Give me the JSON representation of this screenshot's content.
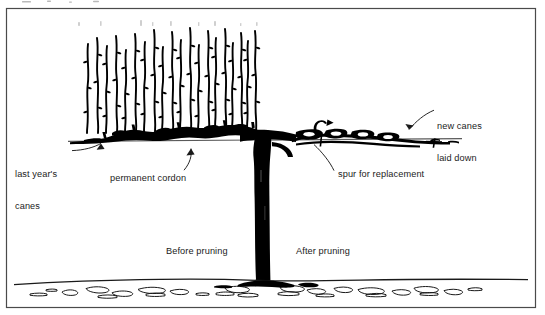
{
  "figure": {
    "frame": {
      "stroke": "#4a4a4a",
      "x": 6,
      "y": 8,
      "width": 530,
      "height": 300
    },
    "colors": {
      "ink": "#000000",
      "label_text": "#1b1b1b",
      "frame": "#4a4a4a",
      "wire": "#555555",
      "soil_outline": "#1a1a1a",
      "background": "#ffffff"
    },
    "labels": [
      {
        "name": "last-years-canes",
        "line1": "last year's",
        "line2": "canes",
        "x": 15,
        "y": 147
      },
      {
        "name": "permanent-cordon",
        "line1": "permanent cordon",
        "line2": "",
        "x": 110,
        "y": 173
      },
      {
        "name": "spur-for-replacement",
        "line1": "spur for replacement",
        "line2": "",
        "x": 338,
        "y": 168
      },
      {
        "name": "new-canes-laid-down",
        "line1": "new canes",
        "line2": "laid down",
        "x": 437,
        "y": 99
      },
      {
        "name": "before-pruning",
        "line1": "Before pruning",
        "line2": "",
        "x": 166,
        "y": 246
      },
      {
        "name": "after-pruning",
        "line1": "After pruning",
        "line2": "",
        "x": 296,
        "y": 246
      }
    ],
    "annotations": {
      "last_years_canes": "last year's\ncanes",
      "last_years_canes_l1": "last year's",
      "last_years_canes_l2": "canes",
      "permanent_cordon": "permanent cordon",
      "spur_for_replacement": "spur for replacement",
      "new_canes_laid_down": "new canes\nlaid down",
      "new_canes_l1": "new canes",
      "new_canes_l2": "laid down",
      "before_pruning": "Before pruning",
      "after_pruning": "After pruning"
    },
    "scene": {
      "wire_y": 140,
      "wire_x_start": 68,
      "wire_x_end": 462,
      "ground_y": 281,
      "trunk_x": 262,
      "trunk_top_y": 140,
      "trunk_bottom_y": 285,
      "cane_count": 20,
      "cane_top_y": 28,
      "cane_base_y": 132,
      "left_half_caption": "Before pruning",
      "right_half_caption": "After pruning"
    }
  }
}
